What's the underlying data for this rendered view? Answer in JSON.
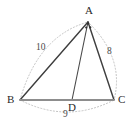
{
  "figure": {
    "kind": "geometry-triangle-diagram",
    "background_color": "#ffffff",
    "solid_stroke_color": "#3a3a3a",
    "base_stroke_color": "#8a8a8a",
    "dotted_stroke_color": "#bdbdbd",
    "label_color": "#2a2a2a"
  },
  "vertices": [
    {
      "id": "A",
      "label": "A",
      "x": 88,
      "y": 22,
      "label_x": 85,
      "label_y": 5
    },
    {
      "id": "B",
      "label": "B",
      "x": 20,
      "y": 100,
      "label_x": 7,
      "label_y": 94
    },
    {
      "id": "C",
      "label": "C",
      "x": 114,
      "y": 100,
      "label_x": 118,
      "label_y": 94
    },
    {
      "id": "D",
      "label": "D",
      "x": 72,
      "y": 100,
      "label_x": 68,
      "label_y": 102
    }
  ],
  "segments": [
    {
      "id": "BA",
      "from": "B",
      "to": "A",
      "style": "solid"
    },
    {
      "id": "AC",
      "from": "A",
      "to": "C",
      "style": "solid"
    },
    {
      "id": "AD",
      "from": "A",
      "to": "D",
      "style": "solid"
    },
    {
      "id": "BC",
      "from": "B",
      "to": "C",
      "style": "solid-base"
    }
  ],
  "arcs": [
    {
      "id": "arc-BA",
      "from": "B",
      "to": "A",
      "style": "dotted",
      "bulge": "outward-left"
    },
    {
      "id": "arc-AC",
      "from": "A",
      "to": "C",
      "style": "dotted",
      "bulge": "outward-right"
    },
    {
      "id": "arc-BC",
      "from": "B",
      "to": "C",
      "style": "dotted",
      "bulge": "downward"
    }
  ],
  "side_labels": [
    {
      "id": "len-AB",
      "text": "10",
      "x": 36,
      "y": 43,
      "on_segment": "BA"
    },
    {
      "id": "len-AC",
      "text": "8",
      "x": 107,
      "y": 47,
      "on_segment": "AC"
    },
    {
      "id": "len-BC",
      "text": "9",
      "x": 63,
      "y": 110,
      "on_segment": "BC"
    }
  ],
  "angle_marks": {
    "vertex": "A",
    "count": 2,
    "description": "angle-bisector-tick-marks"
  }
}
